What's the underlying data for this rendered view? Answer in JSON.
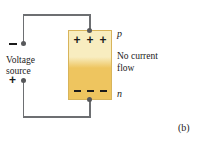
{
  "figure": {
    "caption": "(b)",
    "source_label_line1": "Voltage",
    "source_label_line2": "source",
    "source_negative_sign": "−",
    "source_positive_sign": "+",
    "state_label_line1": "No current",
    "state_label_line2": "flow",
    "region_p_label": "p",
    "region_n_label": "n",
    "p_charges": [
      "+",
      "+",
      "+"
    ],
    "n_charges": [
      "−",
      "−",
      "−"
    ],
    "colors": {
      "p_region": "#f8edc0",
      "n_region": "#eec55f",
      "block_border": "#d8b45a",
      "wire": "#6d6f72",
      "node": "#57585b",
      "text": "#1b1b1b",
      "background": "#ffffff"
    }
  }
}
